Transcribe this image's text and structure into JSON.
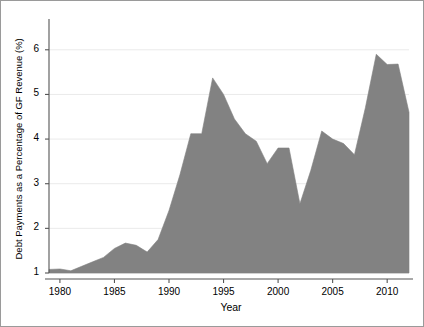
{
  "chart_data": {
    "type": "area",
    "title": "",
    "xlabel": "Year",
    "ylabel": "Debt Payments as a Percentage of GF Revenue (%)",
    "xlim": [
      1979,
      2012
    ],
    "ylim": [
      1,
      6.6
    ],
    "grid": true,
    "legend": null,
    "x_ticks": [
      "1980",
      "1985",
      "1990",
      "1995",
      "2000",
      "2005",
      "2010"
    ],
    "x_tick_values": [
      1980,
      1985,
      1990,
      1995,
      2000,
      2005,
      2010
    ],
    "y_ticks": [
      "1",
      "2",
      "3",
      "4",
      "5",
      "6"
    ],
    "y_tick_values": [
      1,
      2,
      3,
      4,
      5,
      6
    ],
    "series": [
      {
        "name": "Debt Payments as a Percentage of GF Revenue",
        "fill_color": "#828282",
        "x": [
          1979,
          1980,
          1981,
          1982,
          1983,
          1984,
          1985,
          1986,
          1987,
          1988,
          1989,
          1990,
          1991,
          1992,
          1993,
          1994,
          1995,
          1996,
          1997,
          1998,
          1999,
          2000,
          2001,
          2002,
          2003,
          2004,
          2005,
          2006,
          2007,
          2008,
          2009,
          2010,
          2011,
          2012
        ],
        "values": [
          1.08,
          1.09,
          1.05,
          1.15,
          1.25,
          1.35,
          1.55,
          1.67,
          1.62,
          1.47,
          1.75,
          2.4,
          3.2,
          4.12,
          4.12,
          5.37,
          5.0,
          4.45,
          4.12,
          3.95,
          3.45,
          3.8,
          3.8,
          2.55,
          3.3,
          4.18,
          4.0,
          3.9,
          3.65,
          4.7,
          5.9,
          5.67,
          5.68,
          4.6
        ]
      }
    ]
  },
  "axes": {
    "y_title": "Debt Payments as a Percentage of GF Revenue (%)",
    "x_title": "Year"
  }
}
